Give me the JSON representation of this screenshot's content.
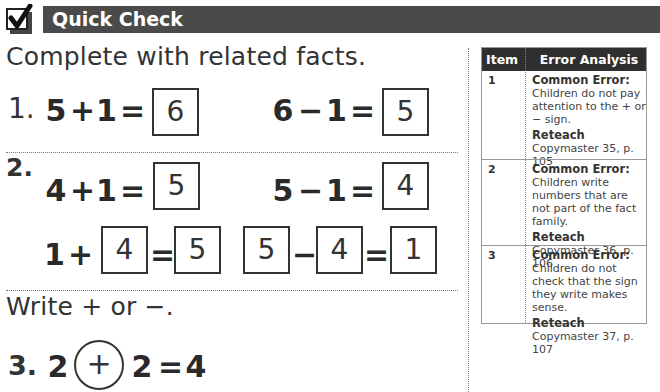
{
  "header": {
    "icon": "checkmark-box-icon",
    "title": "Quick Check",
    "bar_color": "#4a4a4a"
  },
  "section1": {
    "instruction": "Complete with related facts."
  },
  "problems": {
    "p1": {
      "number": "1.",
      "eq1": {
        "a": "5",
        "op": "+",
        "b": "1",
        "eq": "=",
        "answer": "6"
      },
      "eq2": {
        "a": "6",
        "op": "−",
        "b": "1",
        "eq": "=",
        "answer": "5"
      }
    },
    "p2": {
      "number": "2.",
      "eq1": {
        "a": "4",
        "op": "+",
        "b": "1",
        "eq": "=",
        "answer": "5"
      },
      "eq2": {
        "a": "5",
        "op": "−",
        "b": "1",
        "eq": "=",
        "answer": "4"
      },
      "eq3": {
        "a": "1",
        "op": "+",
        "b_box": "4",
        "eq": "=",
        "answer": "5"
      },
      "eq4": {
        "a_box": "5",
        "op": "−",
        "b_box": "4",
        "eq": "=",
        "answer": "1"
      }
    }
  },
  "section2": {
    "instruction": "Write + or −."
  },
  "p3": {
    "number": "3.",
    "a": "2",
    "circled_op": "+",
    "b": "2",
    "eq": "=",
    "result": "4"
  },
  "error_analysis": {
    "headers": {
      "item": "Item",
      "analysis": "Error Analysis"
    },
    "rows": [
      {
        "item": "1",
        "common_error_label": "Common Error:",
        "common_error": "Children do not pay attention to the + or − sign.",
        "reteach_label": "Reteach",
        "reteach": "Copymaster 35, p. 105"
      },
      {
        "item": "2",
        "common_error_label": "Common Error:",
        "common_error": "Children write numbers that are not part of the fact family.",
        "reteach_label": "Reteach",
        "reteach": "Copymaster 36, p. 106"
      },
      {
        "item": "3",
        "common_error_label": "Common Error:",
        "common_error": "Children do not check that the sign they write makes sense.",
        "reteach_label": "Reteach",
        "reteach": "Copymaster 37, p. 107"
      }
    ]
  }
}
